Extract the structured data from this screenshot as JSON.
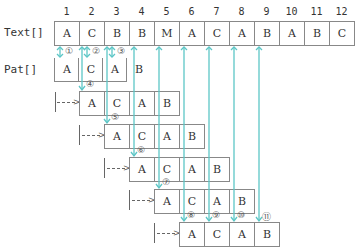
{
  "labels": {
    "text": "Text[]",
    "pat": "Pat[]"
  },
  "indices": [
    "1",
    "2",
    "3",
    "4",
    "5",
    "6",
    "7",
    "8",
    "9",
    "10",
    "11",
    "12"
  ],
  "text": [
    "A",
    "C",
    "B",
    "B",
    "M",
    "A",
    "C",
    "A",
    "B",
    "A",
    "B",
    "C"
  ],
  "pattern": [
    "A",
    "C",
    "A",
    "B"
  ],
  "shifts": [
    {
      "start_col": 2,
      "cells": [
        "A",
        "C",
        "A",
        "B"
      ]
    },
    {
      "start_col": 3,
      "cells": [
        "A",
        "C",
        "A",
        "B"
      ]
    },
    {
      "start_col": 4,
      "cells": [
        "A",
        "C",
        "A",
        "B"
      ]
    },
    {
      "start_col": 5,
      "cells": [
        "A",
        "C",
        "A",
        "B"
      ]
    },
    {
      "start_col": 6,
      "cells": [
        "A",
        "C",
        "A",
        "B"
      ]
    }
  ],
  "steps": [
    "①",
    "②",
    "③",
    "④",
    "⑤",
    "⑥",
    "⑦",
    "⑧",
    "⑨",
    "⑩",
    "⑪"
  ],
  "colors": {
    "arrow": "#5cc6c6",
    "border": "#888888"
  }
}
